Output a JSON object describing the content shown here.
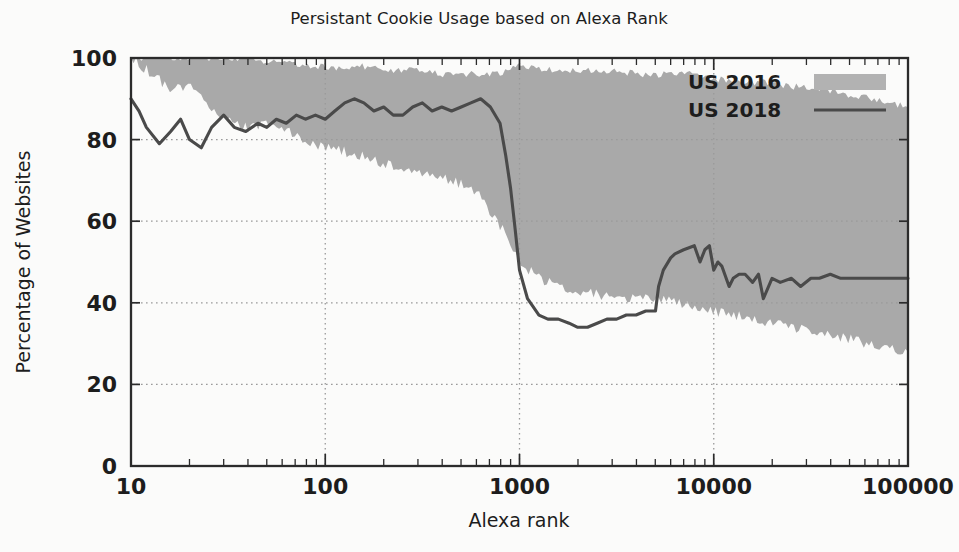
{
  "figure": {
    "title": "Persistant Cookie Usage based on Alexa Rank",
    "xlabel": "Alexa rank",
    "ylabel": "Percentage of Websites",
    "background_color": "#fbfbfa",
    "band_color": "#a9a9a9",
    "line_color": "#4a4a4a",
    "axis_color": "#2b2b2b"
  },
  "legend": {
    "position": "top-right",
    "entries": [
      {
        "label": "US 2016",
        "marker": "filled-band-swatch"
      },
      {
        "label": "US 2018",
        "marker": "solid-line"
      }
    ]
  },
  "axes": {
    "x_tick_labels": [
      "10",
      "100",
      "1000",
      "10000",
      "100000"
    ],
    "y_tick_labels": [
      "0",
      "20",
      "40",
      "60",
      "80",
      "100"
    ]
  },
  "chart_data": {
    "type": "area",
    "title": "Persistant Cookie Usage based on Alexa Rank",
    "xlabel": "Alexa rank",
    "ylabel": "Percentage of Websites",
    "xscale": "log",
    "xlim": [
      10,
      100000
    ],
    "ylim": [
      0,
      100
    ],
    "xticks": [
      10,
      100,
      1000,
      10000,
      100000
    ],
    "yticks": [
      0,
      20,
      40,
      60,
      80,
      100
    ],
    "grid": "dotted-at-major-ticks",
    "legend_position": "upper right",
    "series": [
      {
        "name": "US 2016",
        "render": "shaded band between upper and lower bound",
        "color": "#a9a9a9",
        "x": [
          10,
          13,
          16,
          20,
          25,
          32,
          40,
          50,
          63,
          79,
          100,
          126,
          158,
          200,
          251,
          316,
          398,
          501,
          631,
          794,
          1000,
          1259,
          1585,
          1995,
          2512,
          3162,
          3981,
          5012,
          6310,
          7943,
          10000,
          12589,
          15849,
          19953,
          25119,
          31623,
          39811,
          50119,
          63096,
          79433,
          100000
        ],
        "upper": [
          100,
          100,
          100,
          100,
          100,
          100,
          100,
          99,
          99,
          98,
          98,
          97,
          98,
          97,
          97,
          97,
          96,
          96,
          96,
          96,
          98,
          97,
          97,
          97,
          97,
          97,
          96,
          96,
          96,
          96,
          95,
          94,
          94,
          94,
          93,
          93,
          92,
          91,
          90,
          89,
          88
        ],
        "lower": [
          100,
          96,
          92,
          93,
          88,
          85,
          83,
          84,
          82,
          80,
          78,
          77,
          76,
          74,
          73,
          72,
          71,
          69,
          66,
          59,
          50,
          46,
          44,
          43,
          42,
          41,
          41,
          41,
          40,
          39,
          38,
          37,
          36,
          35,
          34,
          33,
          32,
          31,
          30,
          29,
          28
        ]
      },
      {
        "name": "US 2018",
        "render": "line",
        "color": "#4a4a4a",
        "x": [
          10,
          11,
          12,
          14,
          16,
          18,
          20,
          23,
          26,
          30,
          34,
          39,
          45,
          50,
          56,
          63,
          71,
          79,
          89,
          100,
          112,
          126,
          141,
          158,
          178,
          200,
          224,
          251,
          282,
          316,
          355,
          398,
          447,
          501,
          562,
          631,
          708,
          794,
          850,
          900,
          950,
          1000,
          1100,
          1259,
          1400,
          1585,
          1800,
          1995,
          2239,
          2512,
          2818,
          3162,
          3548,
          3981,
          4467,
          5012,
          5200,
          5500,
          6000,
          6310,
          7000,
          7943,
          8500,
          9000,
          9500,
          10000,
          10500,
          11000,
          12000,
          12589,
          13500,
          14500,
          15849,
          17000,
          18000,
          19953,
          22000,
          25119,
          28000,
          31623,
          35000,
          39811,
          45000,
          50119,
          56000,
          63096,
          71000,
          79433,
          89000,
          100000
        ],
        "y": [
          90,
          87,
          83,
          79,
          82,
          85,
          80,
          78,
          83,
          86,
          83,
          82,
          84,
          83,
          85,
          84,
          86,
          85,
          86,
          85,
          87,
          89,
          90,
          89,
          87,
          88,
          86,
          86,
          88,
          89,
          87,
          88,
          87,
          88,
          89,
          90,
          88,
          84,
          76,
          68,
          58,
          48,
          41,
          37,
          36,
          36,
          35,
          34,
          34,
          35,
          36,
          36,
          37,
          37,
          38,
          38,
          44,
          48,
          51,
          52,
          53,
          54,
          50,
          53,
          54,
          48,
          50,
          49,
          44,
          46,
          47,
          47,
          45,
          47,
          41,
          46,
          45,
          46,
          44,
          46,
          46,
          47,
          46,
          46,
          46,
          46,
          46,
          46,
          46,
          46
        ]
      }
    ]
  }
}
